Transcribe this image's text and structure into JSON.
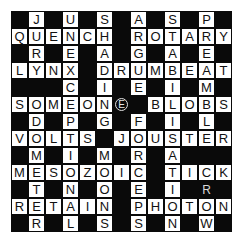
{
  "puzzle": {
    "type": "crossword",
    "size": 13,
    "rows": [
      "#J#U#S#A#S#P#",
      "QUENCH#ROTARY",
      "#R#E#A#G#A#E#",
      "LYNX#DRUMBEAT",
      "###C#I#E#I#M#",
      "SOMEON##BLOBS",
      "#D#P#G#F#I#L#",
      "VOLTS#JOUSTER",
      "#M#I#M#R#A###",
      "MESOZOIC#TICK",
      "#T#N#O#E#I###",
      "RETAIN#PHOTON",
      "#R#L#S#S#N#W#"
    ],
    "marks": [
      {
        "row": 5,
        "col": 6,
        "letter": "E",
        "style": "circled"
      },
      {
        "row": 10,
        "col": 11,
        "letter": "R",
        "style": "plain"
      }
    ],
    "colors": {
      "block": "#0a0a0a",
      "cell": "#ffffff",
      "letter": "#111111",
      "mark": "#d8d8d8"
    }
  }
}
